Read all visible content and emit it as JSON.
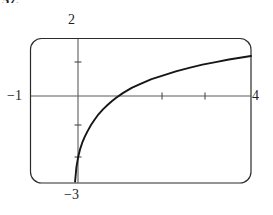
{
  "figure": {
    "problem_number": "57.",
    "window": {
      "left": 30,
      "top": 38,
      "right": 251,
      "bottom": 183,
      "corner_radius": 11,
      "border_color": "#2b2b2b"
    },
    "axes": {
      "x_axis_y": 96,
      "y_axis_x": 78,
      "axis_color": "#5a5a5a",
      "tick_color": "#4a4a4a",
      "x_ticks": [
        162,
        205
      ],
      "y_ticks": [
        62,
        125,
        157
      ]
    },
    "labels": {
      "top": "2",
      "left": "−1",
      "right": "4",
      "bottom": "−3"
    },
    "curve": {
      "color": "#161616",
      "width": 1.9
    }
  },
  "chart_data": {
    "type": "line",
    "title": "",
    "subtitle": "",
    "xlabel": "",
    "ylabel": "",
    "xlim": [
      -1,
      4
    ],
    "ylim": [
      -3,
      2
    ],
    "xticks": [
      -1,
      0,
      1,
      2,
      3,
      4
    ],
    "xtick_labels": [
      "−1",
      "",
      "",
      "",
      "",
      "4"
    ],
    "yticks": [
      -3,
      -2,
      -1,
      0,
      1,
      2
    ],
    "ytick_labels": [
      "−3",
      "",
      "",
      "−1",
      "",
      "2"
    ],
    "grid": false,
    "legend": false,
    "annotations": [
      "vertical asymptote at x = 0",
      "x-intercept near x = 0.85"
    ],
    "series": [
      {
        "name": "y = log(x)",
        "x": [
          0.02,
          0.05,
          0.09,
          0.13,
          0.18,
          0.24,
          0.3,
          0.38,
          0.46,
          0.55,
          0.65,
          0.76,
          0.85,
          0.95,
          1.1,
          1.3,
          1.5,
          1.75,
          2.0,
          2.3,
          2.6,
          2.9,
          3.2,
          3.5,
          3.75,
          4.0
        ],
        "y": [
          -2.95,
          -2.45,
          -2.1,
          -1.85,
          -1.62,
          -1.4,
          -1.22,
          -1.0,
          -0.82,
          -0.63,
          -0.46,
          -0.3,
          -0.18,
          -0.06,
          0.1,
          0.28,
          0.42,
          0.58,
          0.7,
          0.85,
          0.97,
          1.08,
          1.17,
          1.26,
          1.32,
          1.38
        ]
      }
    ]
  }
}
